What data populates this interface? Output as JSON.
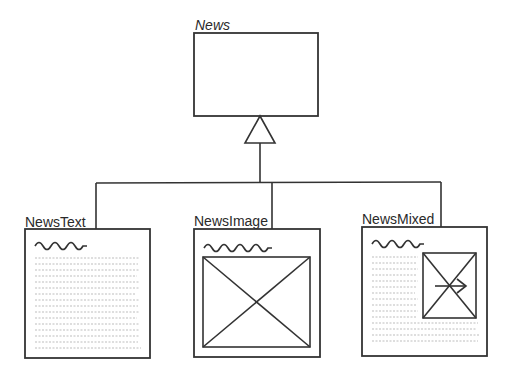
{
  "diagram": {
    "type": "UML class inheritance diagram",
    "parent": {
      "name": "News",
      "italic": true
    },
    "relationship": "generalization",
    "children": [
      {
        "name": "NewsText",
        "content": "text"
      },
      {
        "name": "NewsImage",
        "content": "image"
      },
      {
        "name": "NewsMixed",
        "content": "text+image"
      }
    ],
    "colors": {
      "line": "#333333",
      "text": "#2a2a2a",
      "text_lines": "#bdbdbd",
      "background": "#ffffff"
    }
  }
}
